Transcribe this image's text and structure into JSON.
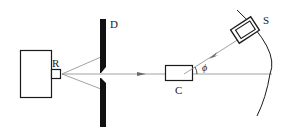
{
  "diagram": {
    "type": "physics-apparatus-schematic",
    "labels": {
      "source": "R",
      "diaphragm": "D",
      "target": "C",
      "detector": "S",
      "angle": "ϕ"
    },
    "colors": {
      "stroke": "#1a1a1a",
      "beam": "#8a8a8a",
      "background": "#ffffff"
    }
  }
}
